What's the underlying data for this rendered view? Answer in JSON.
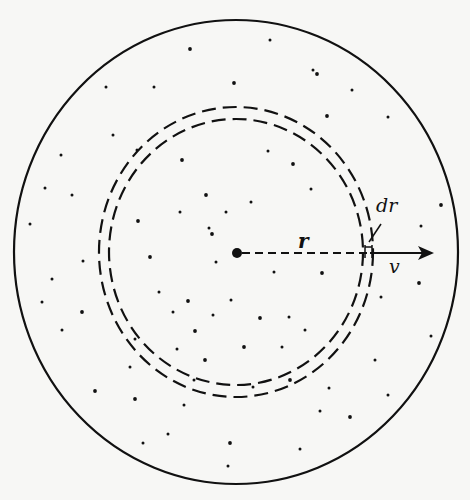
{
  "diagram": {
    "labels": {
      "radius": "r",
      "shell_thickness": "dr",
      "velocity": "v"
    },
    "colors": {
      "ink": "#111111",
      "background": "#f7f7f5"
    },
    "outer_boundary": {
      "cx": 236,
      "cy": 252,
      "rx": 222,
      "ry": 232
    },
    "outer_dashed_circle": {
      "cx": 236,
      "cy": 252,
      "rx": 137,
      "ry": 145
    },
    "inner_dashed_circle": {
      "cx": 236,
      "cy": 252,
      "rx": 127,
      "ry": 133
    },
    "center_point": {
      "x": 237,
      "y": 253,
      "r": 5
    },
    "radius_line": {
      "x1": 242,
      "y1": 253,
      "x2": 370,
      "y2": 253
    },
    "velocity_arrow": {
      "x1": 370,
      "y1": 253,
      "x2": 434,
      "y2": 253
    },
    "particles": [
      [
        190,
        49
      ],
      [
        270,
        40
      ],
      [
        313,
        70
      ],
      [
        317,
        74
      ],
      [
        106,
        87
      ],
      [
        154,
        87
      ],
      [
        234,
        83
      ],
      [
        352,
        90
      ],
      [
        113,
        135
      ],
      [
        327,
        116
      ],
      [
        388,
        117
      ],
      [
        61,
        155
      ],
      [
        182,
        160
      ],
      [
        268,
        151
      ],
      [
        137,
        150
      ],
      [
        293,
        164
      ],
      [
        45,
        188
      ],
      [
        72,
        195
      ],
      [
        206,
        195
      ],
      [
        251,
        202
      ],
      [
        311,
        189
      ],
      [
        138,
        221
      ],
      [
        226,
        212
      ],
      [
        180,
        212
      ],
      [
        441,
        205
      ],
      [
        30,
        224
      ],
      [
        209,
        228
      ],
      [
        212,
        234
      ],
      [
        421,
        226
      ],
      [
        83,
        261
      ],
      [
        150,
        257
      ],
      [
        216,
        262
      ],
      [
        274,
        272
      ],
      [
        322,
        273
      ],
      [
        52,
        279
      ],
      [
        159,
        292
      ],
      [
        188,
        301
      ],
      [
        231,
        300
      ],
      [
        42,
        302
      ],
      [
        82,
        312
      ],
      [
        173,
        312
      ],
      [
        213,
        315
      ],
      [
        260,
        318
      ],
      [
        289,
        317
      ],
      [
        62,
        330
      ],
      [
        195,
        331
      ],
      [
        305,
        330
      ],
      [
        381,
        297
      ],
      [
        419,
        283
      ],
      [
        431,
        336
      ],
      [
        135,
        339
      ],
      [
        244,
        347
      ],
      [
        282,
        347
      ],
      [
        177,
        349
      ],
      [
        205,
        360
      ],
      [
        130,
        367
      ],
      [
        375,
        360
      ],
      [
        95,
        391
      ],
      [
        194,
        380
      ],
      [
        253,
        387
      ],
      [
        290,
        380
      ],
      [
        329,
        388
      ],
      [
        388,
        395
      ],
      [
        135,
        399
      ],
      [
        184,
        405
      ],
      [
        320,
        411
      ],
      [
        350,
        417
      ],
      [
        168,
        434
      ],
      [
        143,
        443
      ],
      [
        230,
        443
      ],
      [
        300,
        449
      ],
      [
        228,
        466
      ]
    ]
  }
}
